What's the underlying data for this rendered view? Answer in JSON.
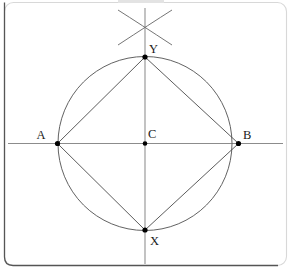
{
  "figure": {
    "caption_fragment": "",
    "labels": {
      "point_a": "A",
      "point_b": "B",
      "point_c": "C",
      "point_x": "X",
      "point_y": "Y"
    },
    "colors": {
      "circle_stroke": "#5a5a5a",
      "chord_stroke": "#4a4a4a",
      "axis_stroke": "#8c8c8c",
      "arc_stroke": "#6e6e6e",
      "vertex_fill": "#000000",
      "frame_stroke": "#d8d8d8",
      "background": "#ffffff",
      "label_fill": "#1a1a1a"
    },
    "geometry": {
      "center": {
        "x": 145,
        "y": 143.5
      },
      "radius": 87,
      "points": {
        "A": {
          "x": 57.5,
          "y": 143.5
        },
        "B": {
          "x": 238.5,
          "y": 143.5
        },
        "C": {
          "x": 145,
          "y": 143.5
        },
        "Y": {
          "x": 145,
          "y": 57
        },
        "X": {
          "x": 145,
          "y": 230
        }
      },
      "horizontal_axis": {
        "x1": 8,
        "y1": 143.5,
        "x2": 283,
        "y2": 143.5
      },
      "vertical_axis": {
        "x1": 145,
        "y1": 8,
        "x2": 145,
        "y2": 264
      },
      "rhombus_vertices": [
        "A",
        "Y",
        "B",
        "X"
      ],
      "construction_arc_crossing": {
        "x": 145,
        "y": 28
      }
    },
    "frame": {
      "x": 4,
      "y": 2,
      "width": 283,
      "height": 264,
      "corner_radius": 9
    }
  }
}
